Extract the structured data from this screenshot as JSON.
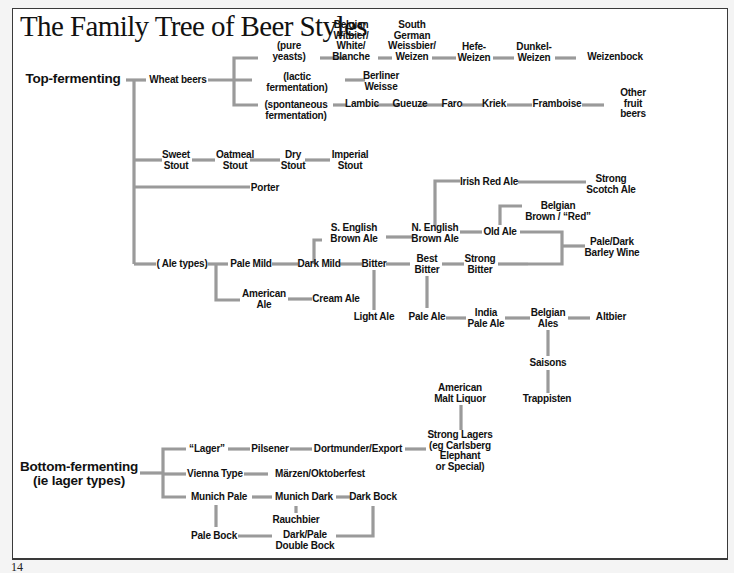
{
  "title": "The Family Tree of Beer Styles",
  "page_number": "14",
  "colors": {
    "line": "#9a9a9a",
    "text": "#111111",
    "frame": "#3a3a3a",
    "paper": "#ffffff"
  },
  "nodes": {
    "top_fermenting": "Top-fermenting",
    "wheat_beers": "Wheat beers",
    "pure_yeasts": "(pure\nyeasts)",
    "lactic": "(lactic\nfermentation)",
    "spontaneous": "(spontaneous\nfermentation)",
    "belgian_witbier": "Belgian\nWitbier/\nWhite/\nBlanche",
    "south_german": "South\nGerman\nWeissbier/\nWeizen",
    "hefe_weizen": "Hefe-\nWeizen",
    "dunkel_weizen": "Dunkel-\nWeizen",
    "weizenbock": "Weizenbock",
    "berliner_weisse": "Berliner\nWeisse",
    "lambic": "Lambic",
    "gueuze": "Gueuze",
    "faro": "Faro",
    "kriek": "Kriek",
    "framboise": "Framboise",
    "other_fruit": "Other\nfruit\nbeers",
    "sweet_stout": "Sweet\nStout",
    "oatmeal_stout": "Oatmeal\nStout",
    "dry_stout": "Dry\nStout",
    "imperial_stout": "Imperial\nStout",
    "porter": "Porter",
    "irish_red": "Irish Red Ale",
    "strong_scotch": "Strong\nScotch Ale",
    "belgian_brown": "Belgian\nBrown / “Red”",
    "s_english_brown": "S. English\nBrown Ale",
    "n_english_brown": "N. English\nBrown Ale",
    "old_ale": "Old Ale",
    "barley_wine": "Pale/Dark\nBarley Wine",
    "ale_types": "( Ale types)",
    "pale_mild": "Pale Mild",
    "dark_mild": "Dark Mild",
    "bitter": "Bitter",
    "best_bitter": "Best\nBitter",
    "strong_bitter": "Strong\nBitter",
    "american_ale": "American\nAle",
    "cream_ale": "Cream Ale",
    "light_ale": "Light Ale",
    "pale_ale": "Pale Ale",
    "india_pale_ale": "India\nPale Ale",
    "belgian_ales": "Belgian\nAles",
    "altbier": "Altbier",
    "saisons": "Saisons",
    "trappisten": "Trappisten",
    "american_malt_liquor": "American\nMalt Liquor",
    "strong_lagers": "Strong Lagers\n(eg Carlsberg\nElephant\nor Special)",
    "bottom_fermenting": "Bottom-fermenting\n(ie lager types)",
    "lager": "“Lager”",
    "pilsener": "Pilsener",
    "dortmunder": "Dortmunder/Export",
    "vienna": "Vienna Type",
    "marzen": "Märzen/Oktoberfest",
    "munich_pale": "Munich Pale",
    "munich_dark": "Munich Dark",
    "dark_bock": "Dark Bock",
    "rauchbier": "Rauchbier",
    "pale_bock": "Pale Bock",
    "double_bock": "Dark/Pale\nDouble Bock"
  }
}
